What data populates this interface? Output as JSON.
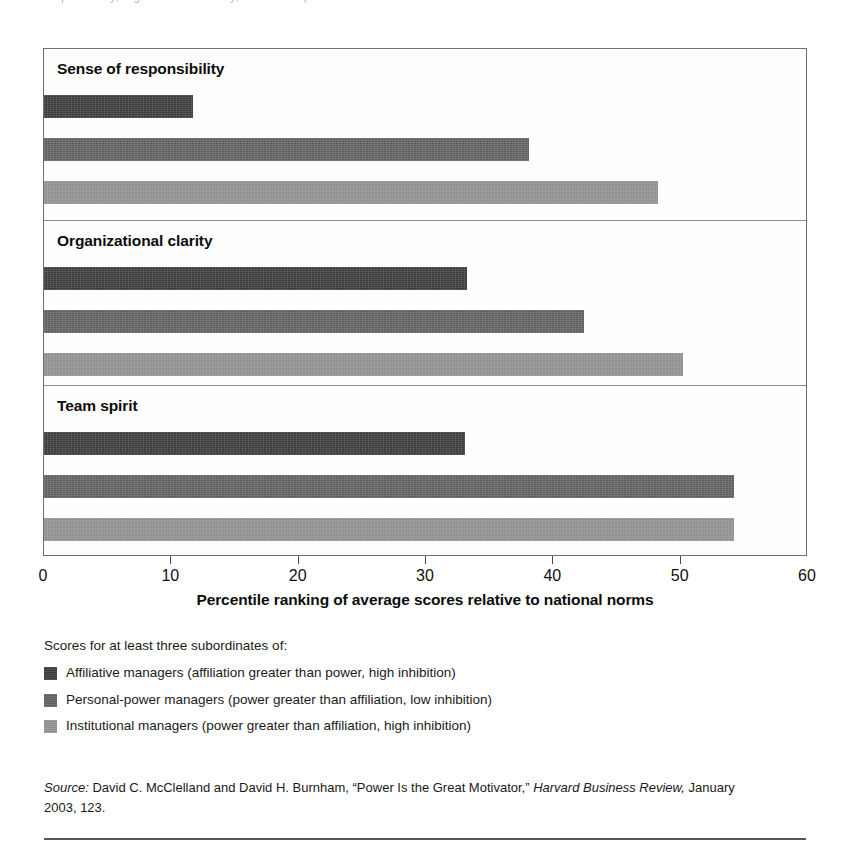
{
  "figure": {
    "top_clipped_ghost_text": "responsibility, organizational clarity, and team spirit",
    "axis_title": "Percentile ranking of average scores relative to national norms"
  },
  "legend": {
    "intro": "Scores for at least three subordinates of:",
    "items": [
      {
        "label": "Affiliative managers (affiliation greater than power, high inhibition)",
        "color": "#3a3a3a"
      },
      {
        "label": "Personal-power managers (power greater than affiliation, low inhibition)",
        "color": "#5e5e5e"
      },
      {
        "label": "Institutional managers (power greater than affiliation, high inhibition)",
        "color": "#8e8e8e"
      }
    ]
  },
  "source": {
    "label": "Source:",
    "text_before_italic": " David C. McClelland and David H. Burnham, “Power Is the Great Motivator,” ",
    "publication": "Harvard Business Review,",
    "text_after_italic": " January 2003, 123."
  },
  "chart_data": {
    "type": "bar",
    "orientation": "horizontal",
    "title": "",
    "xlabel": "Percentile ranking of average scores relative to national norms",
    "ylabel": "",
    "xlim": [
      0,
      60
    ],
    "xticks": [
      0,
      10,
      20,
      30,
      40,
      50,
      60
    ],
    "xtick_labels": [
      "0",
      "10",
      "20",
      "30",
      "40",
      "50",
      "60"
    ],
    "grid": false,
    "legend_position": "below",
    "categories": [
      "Sense of responsibility",
      "Organizational clarity",
      "Team spirit"
    ],
    "series": [
      {
        "name": "Affiliative managers (affiliation greater than power, high inhibition)",
        "color": "#3a3a3a",
        "values": [
          11.7,
          33.2,
          33.1
        ]
      },
      {
        "name": "Personal-power managers (power greater than affiliation, low inhibition)",
        "color": "#5e5e5e",
        "values": [
          38.1,
          42.4,
          54.2
        ]
      },
      {
        "name": "Institutional managers (power greater than affiliation, high inhibition)",
        "color": "#8e8e8e",
        "values": [
          48.2,
          50.2,
          54.2
        ]
      }
    ]
  }
}
